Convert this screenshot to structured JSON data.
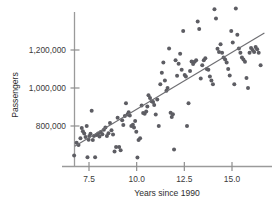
{
  "chart_data": {
    "type": "scatter",
    "title": "",
    "subtitle": "",
    "xlabel": "Years since 1990",
    "ylabel": "Passengers",
    "xlim": [
      6.6,
      16.7
    ],
    "ylim": [
      620000,
      1430000
    ],
    "grid": false,
    "legend": null,
    "legend_position": "none",
    "xticks": [
      7.5,
      10.0,
      12.5,
      15.0
    ],
    "xtick_labels": [
      "7.5",
      "10.0",
      "12.5",
      "15.0"
    ],
    "yticks": [
      800000,
      1000000,
      1200000
    ],
    "ytick_labels": [
      "800,000",
      "1,000,000",
      "1,200,000"
    ],
    "marker": "filled-circle",
    "marker_color": "#5d5d63",
    "marker_size_px": 2.0,
    "trend_line": {
      "type": "linear-regression",
      "color": "#6e6e72",
      "x_start": 6.75,
      "y_start": 694000,
      "x_end": 16.7,
      "y_end": 1290000,
      "slope_per_year": 59900,
      "intercept": 289700
    },
    "n_points": 130,
    "points": [
      [
        6.72,
        645000
      ],
      [
        6.85,
        712000
      ],
      [
        6.95,
        700000
      ],
      [
        7.05,
        735000
      ],
      [
        7.12,
        790000
      ],
      [
        7.18,
        772000
      ],
      [
        7.25,
        760000
      ],
      [
        7.32,
        742000
      ],
      [
        7.38,
        800000
      ],
      [
        7.42,
        636000
      ],
      [
        7.48,
        727000
      ],
      [
        7.52,
        748000
      ],
      [
        7.58,
        759000
      ],
      [
        7.64,
        880000
      ],
      [
        7.7,
        726000
      ],
      [
        7.76,
        748000
      ],
      [
        7.82,
        636000
      ],
      [
        7.9,
        752000
      ],
      [
        7.98,
        760000
      ],
      [
        8.05,
        745000
      ],
      [
        8.12,
        768000
      ],
      [
        8.2,
        756000
      ],
      [
        8.28,
        780000
      ],
      [
        8.36,
        792000
      ],
      [
        8.44,
        748000
      ],
      [
        8.52,
        762000
      ],
      [
        8.6,
        816000
      ],
      [
        8.68,
        778000
      ],
      [
        8.76,
        755000
      ],
      [
        8.84,
        666000
      ],
      [
        8.92,
        690000
      ],
      [
        9.0,
        844000
      ],
      [
        9.08,
        690000
      ],
      [
        9.16,
        672000
      ],
      [
        9.24,
        830000
      ],
      [
        9.3,
        805000
      ],
      [
        9.38,
        852000
      ],
      [
        9.44,
        920000
      ],
      [
        9.52,
        860000
      ],
      [
        9.58,
        872000
      ],
      [
        9.64,
        855000
      ],
      [
        9.72,
        800000
      ],
      [
        9.8,
        806000
      ],
      [
        9.86,
        792000
      ],
      [
        9.92,
        826000
      ],
      [
        9.98,
        770000
      ],
      [
        10.04,
        634000
      ],
      [
        10.1,
        726000
      ],
      [
        10.18,
        736000
      ],
      [
        10.26,
        908000
      ],
      [
        10.34,
        868000
      ],
      [
        10.42,
        864000
      ],
      [
        10.5,
        876000
      ],
      [
        10.56,
        902000
      ],
      [
        10.62,
        962000
      ],
      [
        10.7,
        948000
      ],
      [
        10.78,
        930000
      ],
      [
        10.86,
        926000
      ],
      [
        10.92,
        910000
      ],
      [
        11.0,
        860000
      ],
      [
        11.08,
        940000
      ],
      [
        11.16,
        800000
      ],
      [
        11.24,
        1020000
      ],
      [
        11.32,
        1080000
      ],
      [
        11.4,
        1134000
      ],
      [
        11.48,
        1040000
      ],
      [
        11.56,
        986000
      ],
      [
        11.62,
        1000000
      ],
      [
        11.7,
        1208000
      ],
      [
        11.78,
        870000
      ],
      [
        11.84,
        848000
      ],
      [
        11.9,
        862000
      ],
      [
        11.96,
        676000
      ],
      [
        12.04,
        1146000
      ],
      [
        12.12,
        1064000
      ],
      [
        12.2,
        1128000
      ],
      [
        12.28,
        1180000
      ],
      [
        12.36,
        1096000
      ],
      [
        12.44,
        1300000
      ],
      [
        12.52,
        1068000
      ],
      [
        12.58,
        1060000
      ],
      [
        12.64,
        800000
      ],
      [
        12.72,
        920000
      ],
      [
        12.8,
        1090000
      ],
      [
        12.88,
        1140000
      ],
      [
        12.96,
        1126000
      ],
      [
        13.04,
        1138000
      ],
      [
        13.12,
        1146000
      ],
      [
        13.2,
        1350000
      ],
      [
        13.28,
        1310000
      ],
      [
        13.36,
        1050000
      ],
      [
        13.44,
        1120000
      ],
      [
        13.52,
        1146000
      ],
      [
        13.6,
        1156000
      ],
      [
        13.68,
        1100000
      ],
      [
        13.76,
        1096000
      ],
      [
        13.84,
        1060000
      ],
      [
        13.92,
        1040000
      ],
      [
        14.0,
        1020000
      ],
      [
        14.08,
        1414000
      ],
      [
        14.16,
        1366000
      ],
      [
        14.24,
        1206000
      ],
      [
        14.32,
        1190000
      ],
      [
        14.4,
        1230000
      ],
      [
        14.48,
        1186000
      ],
      [
        14.56,
        1160000
      ],
      [
        14.64,
        1150000
      ],
      [
        14.72,
        1134000
      ],
      [
        14.8,
        1100000
      ],
      [
        14.88,
        1066000
      ],
      [
        14.96,
        1300000
      ],
      [
        15.04,
        1240000
      ],
      [
        15.12,
        1020000
      ],
      [
        15.2,
        1418000
      ],
      [
        15.28,
        1280000
      ],
      [
        15.36,
        1208000
      ],
      [
        15.44,
        1186000
      ],
      [
        15.52,
        1160000
      ],
      [
        15.6,
        1150000
      ],
      [
        15.68,
        1138000
      ],
      [
        15.76,
        1052000
      ],
      [
        15.84,
        1000000
      ],
      [
        15.92,
        1186000
      ],
      [
        16.0,
        1210000
      ],
      [
        16.08,
        1200000
      ],
      [
        16.16,
        1190000
      ],
      [
        16.24,
        1216000
      ],
      [
        16.32,
        1204000
      ],
      [
        16.4,
        1186000
      ],
      [
        16.5,
        1120000
      ]
    ]
  }
}
